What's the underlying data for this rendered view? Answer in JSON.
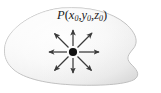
{
  "figure": {
    "name": "point-in-region-diagram",
    "background_color": "#ffffff"
  },
  "region": {
    "name": "solid-region-blob",
    "fill_light": "#fcfcfc",
    "fill_mid": "#f2f2f2",
    "fill_dark": "#e0e0e0",
    "outline_color": "#b4b4b4",
    "outline_width": "0.9"
  },
  "point": {
    "label_prefix": "P",
    "open_paren": "(",
    "close_paren": ")",
    "coord_x": "x",
    "coord_y": "y",
    "coord_z": "z",
    "subscript": "0",
    "separator": ",",
    "full_label": "P(x0, y0, z0)",
    "marker_color": "#111111",
    "marker_radius": "4.1",
    "center_x": "73",
    "center_y": "52"
  },
  "arrows": {
    "name": "radiating-direction-arrows",
    "count": 8,
    "color": "#3b3b3b",
    "stroke_width": "1.25",
    "directions": [
      {
        "name": "arrow-east",
        "angle_deg": 0,
        "length": 27
      },
      {
        "name": "arrow-northeast",
        "angle_deg": 45,
        "length": 26
      },
      {
        "name": "arrow-north",
        "angle_deg": 90,
        "length": 24
      },
      {
        "name": "arrow-northwest",
        "angle_deg": 135,
        "length": 26
      },
      {
        "name": "arrow-west",
        "angle_deg": 180,
        "length": 26
      },
      {
        "name": "arrow-southwest",
        "angle_deg": 225,
        "length": 26
      },
      {
        "name": "arrow-south",
        "angle_deg": 270,
        "length": 24
      },
      {
        "name": "arrow-southeast",
        "angle_deg": 315,
        "length": 26
      }
    ]
  }
}
